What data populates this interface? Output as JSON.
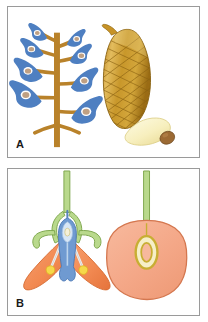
{
  "figure": {
    "background_color": "#ffffff",
    "width": 208,
    "height": 322,
    "panels": [
      {
        "id": "panel-a",
        "label": "A",
        "caption_text": "A",
        "border_color": "#9a9a9a",
        "subjects": [
          {
            "name": "gymnosperm-branch-with-ovules",
            "description": "branching brown axis bearing blue scale-like structures each containing a tan ovule",
            "axis_color": "#b9822a",
            "scale_color": "#4e7fc1",
            "ovule_color": "#bfa083",
            "ovule_ring_color": "#ffffff",
            "scale_count": 8
          },
          {
            "name": "pine-cone",
            "description": "mature elongated brown seed cone with diamond scale pattern",
            "body_color": "#c79327",
            "shade_color": "#9d6f17",
            "highlight_color": "#e6c46a",
            "outline_color": "#8a6211"
          },
          {
            "name": "winged-seed",
            "description": "pale cream winged seed with brown seed body at tip",
            "wing_color": "#f8f1c2",
            "wing_outline_color": "#ddd08a",
            "seed_color": "#9c6a34"
          }
        ]
      },
      {
        "id": "panel-b",
        "label": "B",
        "caption_text": "B",
        "border_color": "#9a9a9a",
        "subjects": [
          {
            "name": "angiosperm-flower-longitudinal-section",
            "description": "flower in section: green pedicel and sepals, orange petals, blue pistil enclosing ovule, two yellow anthers on filaments",
            "pedicel_color": "#9fc46a",
            "sepal_color": "#9fc46a",
            "petal_color": "#f28a52",
            "pistil_color": "#6f9ad1",
            "anther_color": "#f6d84a",
            "filament_color": "#f2f2f2",
            "ovule_color": "#f5f0d8"
          },
          {
            "name": "fruit-cross-section",
            "description": "rounded salmon fruit in section on a green stalk with a single yellow-rimmed seed inside",
            "pericarp_color": "#f4a787",
            "pericarp_outline_color": "#d4774f",
            "stalk_color": "#9fc46a",
            "seed_ring_color": "#c8ae33",
            "seed_fill_color": "#f6efc8"
          }
        ]
      }
    ]
  },
  "colors": {
    "panel_border": "#9a9a9a",
    "label_text": "#1a1a1a",
    "page_background": "#ffffff",
    "branch_brown": "#b9822a",
    "ovule_scale_blue": "#4e7fc1",
    "cone_gold": "#c79327",
    "petal_orange": "#f28a52",
    "sepal_green": "#9fc46a",
    "pistil_blue": "#6f9ad1",
    "anther_yellow": "#f6d84a",
    "fruit_salmon": "#f4a787"
  }
}
